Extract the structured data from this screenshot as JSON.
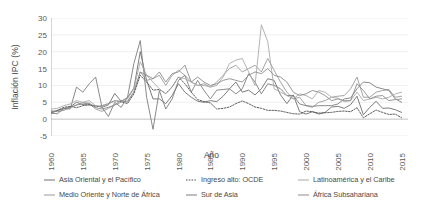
{
  "chart_data": {
    "type": "line",
    "title": "",
    "xlabel": "Año",
    "ylabel": "Inflación IPC (%)",
    "xlim": [
      1960,
      2016
    ],
    "ylim": [
      -5,
      30
    ],
    "xticks": [
      1960,
      1965,
      1970,
      1975,
      1980,
      1985,
      1990,
      1995,
      2000,
      2005,
      2010,
      2015
    ],
    "yticks": [
      -5,
      0,
      5,
      10,
      15,
      20,
      25,
      30
    ],
    "grid": true,
    "grid_axis": "y",
    "legend_position": "bottom",
    "x": [
      1960,
      1961,
      1962,
      1963,
      1964,
      1965,
      1966,
      1967,
      1968,
      1969,
      1970,
      1971,
      1972,
      1973,
      1974,
      1975,
      1976,
      1977,
      1978,
      1979,
      1980,
      1981,
      1982,
      1983,
      1984,
      1985,
      1986,
      1987,
      1988,
      1989,
      1990,
      1991,
      1992,
      1993,
      1994,
      1995,
      1996,
      1997,
      1998,
      1999,
      2000,
      2001,
      2002,
      2003,
      2004,
      2005,
      2006,
      2007,
      2008,
      2009,
      2010,
      2011,
      2012,
      2013,
      2014,
      2015
    ],
    "series": [
      {
        "name": "Asia Oriental y el Pacífico",
        "style": "solid",
        "color": "#6e6e6e",
        "values": [
          2.0,
          2.5,
          3.0,
          3.6,
          5.0,
          4.3,
          4.2,
          4.0,
          3.5,
          4.2,
          7.6,
          5.3,
          6.4,
          9.2,
          20.0,
          11.5,
          6.0,
          6.0,
          4.6,
          7.0,
          10.5,
          8.0,
          6.5,
          5.3,
          5.0,
          5.5,
          5.2,
          6.8,
          9.0,
          11.0,
          8.0,
          8.6,
          7.2,
          9.0,
          12.0,
          11.5,
          7.2,
          4.6,
          7.2,
          2.2,
          1.5,
          2.2,
          1.5,
          2.0,
          3.6,
          3.8,
          3.2,
          4.3,
          6.8,
          1.3,
          3.5,
          5.3,
          3.2,
          3.3,
          2.8,
          2.0
        ]
      },
      {
        "name": "Medio Oriente y Norte de África",
        "style": "solid",
        "color": "#9a9a9a",
        "values": [
          1.5,
          2.6,
          3.2,
          3.5,
          4.2,
          5.0,
          4.6,
          3.0,
          2.3,
          3.2,
          4.2,
          5.0,
          5.4,
          8.0,
          14.0,
          11.5,
          12.0,
          13.0,
          10.0,
          13.0,
          14.5,
          13.0,
          11.0,
          10.0,
          10.5,
          9.5,
          11.0,
          13.0,
          15.0,
          16.0,
          14.0,
          15.0,
          16.0,
          14.0,
          18.0,
          14.5,
          11.0,
          8.0,
          6.0,
          6.5,
          4.0,
          3.5,
          5.0,
          5.5,
          6.5,
          6.8,
          7.0,
          9.0,
          12.5,
          6.5,
          6.5,
          8.0,
          8.5,
          8.8,
          6.5,
          6.8
        ]
      },
      {
        "name": "Ingreso alto: OCDE",
        "style": "dotted",
        "color": "#4d4d4d",
        "values": [
          2.0,
          2.6,
          3.5,
          3.8,
          3.4,
          4.0,
          4.3,
          3.6,
          4.0,
          4.6,
          5.5,
          5.2,
          4.6,
          7.5,
          13.0,
          11.0,
          8.6,
          8.8,
          7.6,
          9.6,
          12.5,
          10.5,
          8.0,
          5.8,
          5.2,
          4.8,
          3.0,
          3.2,
          3.6,
          4.6,
          5.4,
          4.6,
          3.6,
          3.2,
          2.6,
          2.6,
          2.4,
          2.0,
          1.6,
          1.5,
          2.4,
          2.2,
          1.8,
          1.9,
          2.0,
          2.3,
          2.4,
          2.2,
          3.4,
          0.4,
          1.6,
          2.7,
          2.0,
          1.4,
          1.5,
          0.4
        ]
      },
      {
        "name": "Sur de Asia",
        "style": "solid",
        "color": "#7d7d7d",
        "values": [
          1.8,
          1.6,
          3.2,
          3.0,
          9.5,
          8.0,
          10.5,
          12.5,
          3.5,
          0.8,
          5.0,
          3.5,
          6.5,
          16.5,
          23.3,
          6.5,
          -3.0,
          8.5,
          3.0,
          6.0,
          11.5,
          13.0,
          8.0,
          11.5,
          8.5,
          6.0,
          8.6,
          8.8,
          9.0,
          7.5,
          9.0,
          13.5,
          11.0,
          7.5,
          10.5,
          10.0,
          9.0,
          7.0,
          7.0,
          4.5,
          4.0,
          3.8,
          4.0,
          4.0,
          4.0,
          4.5,
          6.0,
          6.3,
          9.0,
          11.0,
          10.8,
          9.5,
          9.0,
          8.5,
          6.0,
          5.0
        ]
      },
      {
        "name": "Latinoamérica y el Caribe",
        "style": "solid",
        "color": "#aaaaaa",
        "values": [
          3.0,
          3.2,
          4.0,
          4.5,
          5.5,
          5.0,
          5.5,
          4.0,
          3.8,
          4.5,
          5.4,
          5.4,
          6.0,
          9.0,
          17.0,
          13.0,
          11.0,
          9.0,
          7.5,
          9.5,
          12.5,
          12.0,
          11.0,
          10.0,
          10.0,
          9.5,
          10.0,
          12.5,
          16.5,
          17.5,
          18.0,
          14.0,
          10.0,
          28.0,
          23.0,
          9.0,
          8.0,
          7.0,
          6.0,
          7.5,
          7.0,
          6.0,
          8.5,
          8.0,
          6.5,
          6.2,
          5.2,
          5.5,
          8.0,
          5.5,
          6.0,
          6.5,
          6.0,
          6.5,
          7.5,
          8.0
        ]
      },
      {
        "name": "África Subsahariana",
        "style": "solid",
        "color": "#8c8c8c",
        "values": [
          2.5,
          2.2,
          2.6,
          3.4,
          4.2,
          4.5,
          4.8,
          3.4,
          3.0,
          3.5,
          4.2,
          5.6,
          5.0,
          8.0,
          14.0,
          13.0,
          12.0,
          14.0,
          11.0,
          13.5,
          14.0,
          16.0,
          11.0,
          12.5,
          11.0,
          10.0,
          10.5,
          11.5,
          12.0,
          11.5,
          11.0,
          13.0,
          14.0,
          13.5,
          15.0,
          13.0,
          12.5,
          11.0,
          8.0,
          7.0,
          7.5,
          8.5,
          8.0,
          7.0,
          5.5,
          6.0,
          5.5,
          5.5,
          10.5,
          8.5,
          6.0,
          6.8,
          7.0,
          5.5,
          5.8,
          6.0
        ]
      }
    ]
  },
  "legend": {
    "items": [
      {
        "label": "Asia Oriental y el Pacífico",
        "style": "solid",
        "color": "#6e6e6e"
      },
      {
        "label": "Ingreso alto: OCDE",
        "style": "dotted",
        "color": "#4d4d4d"
      },
      {
        "label": "Latinoamérica y el Caribe",
        "style": "solid",
        "color": "#aaaaaa"
      },
      {
        "label": "Medio Oriente y Norte de África",
        "style": "solid",
        "color": "#9a9a9a"
      },
      {
        "label": "Sur de Asia",
        "style": "solid",
        "color": "#7d7d7d"
      },
      {
        "label": "África Subsahariana",
        "style": "solid",
        "color": "#8c8c8c"
      }
    ]
  }
}
